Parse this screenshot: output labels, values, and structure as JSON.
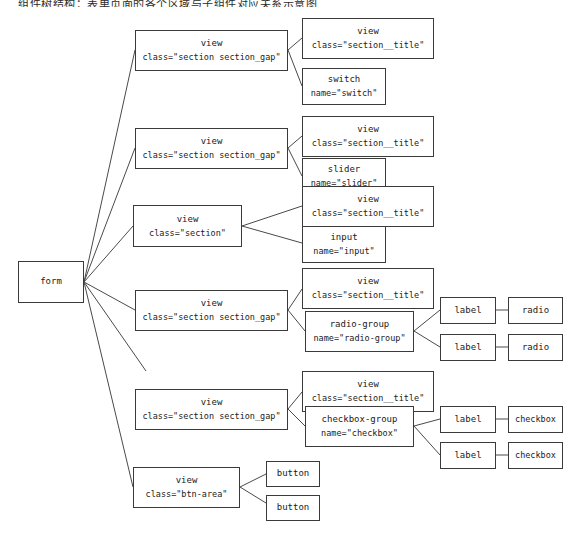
{
  "diagram": {
    "title_strip": "组件树结构：表单页面的各个区域与子组件对应关系示意图",
    "root": {
      "tag": "form",
      "attr": ""
    },
    "sections": [
      {
        "id": "section-switch",
        "tag": "view",
        "attr": "class=\"section section_gap\"",
        "children": [
          {
            "id": "title-1",
            "tag": "view",
            "attr": "class=\"section__title\""
          },
          {
            "id": "switch-1",
            "tag": "switch",
            "attr": "name=\"switch\""
          }
        ]
      },
      {
        "id": "section-slider",
        "tag": "view",
        "attr": "class=\"section section_gap\"",
        "children": [
          {
            "id": "title-2",
            "tag": "view",
            "attr": "class=\"section__title\""
          },
          {
            "id": "slider-1",
            "tag": "slider",
            "attr": "name=\"slider\""
          }
        ]
      },
      {
        "id": "section-input",
        "tag": "view",
        "attr": "class=\"section\"",
        "children": [
          {
            "id": "title-3",
            "tag": "view",
            "attr": "class=\"section__title\""
          },
          {
            "id": "input-1",
            "tag": "input",
            "attr": "name=\"input\""
          }
        ]
      },
      {
        "id": "section-radio",
        "tag": "view",
        "attr": "class=\"section section_gap\"",
        "children": [
          {
            "id": "title-4",
            "tag": "view",
            "attr": "class=\"section__title\""
          },
          {
            "id": "radio-group",
            "tag": "radio-group",
            "attr": "name=\"radio-group\"",
            "children": [
              {
                "id": "label-r1",
                "tag": "label",
                "attr": "",
                "leaf": {
                  "tag": "radio",
                  "attr": ""
                }
              },
              {
                "id": "label-r2",
                "tag": "label",
                "attr": "",
                "leaf": {
                  "tag": "radio",
                  "attr": ""
                }
              }
            ]
          }
        ]
      },
      {
        "id": "section-checkbox",
        "tag": "view",
        "attr": "class=\"section section_gap\"",
        "children": [
          {
            "id": "title-5",
            "tag": "view",
            "attr": "class=\"section__title\""
          },
          {
            "id": "checkbox-group",
            "tag": "checkbox-group",
            "attr": "name=\"checkbox\"",
            "children": [
              {
                "id": "label-c1",
                "tag": "label",
                "attr": "",
                "leaf": {
                  "tag": "checkbox",
                  "attr": ""
                }
              },
              {
                "id": "label-c2",
                "tag": "label",
                "attr": "",
                "leaf": {
                  "tag": "checkbox",
                  "attr": ""
                }
              }
            ]
          }
        ]
      },
      {
        "id": "section-btnarea",
        "tag": "view",
        "attr": "class=\"btn-area\"",
        "children": [
          {
            "id": "button-1",
            "tag": "button",
            "attr": ""
          },
          {
            "id": "button-2",
            "tag": "button",
            "attr": ""
          }
        ]
      }
    ],
    "style": {
      "line_color": "#4a4a4a",
      "border_color": "#3a3a3a",
      "background": "#ffffff",
      "text_color": "#1a1a1a"
    }
  }
}
